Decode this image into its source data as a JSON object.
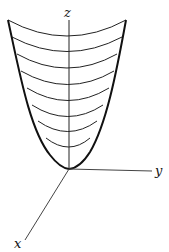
{
  "diagram": {
    "axes": {
      "z_label": "z",
      "y_label": "y",
      "x_label": "x"
    },
    "colors": {
      "stroke": "#111111",
      "axis": "#333333",
      "background": "#ffffff"
    },
    "level_curves": 8
  }
}
